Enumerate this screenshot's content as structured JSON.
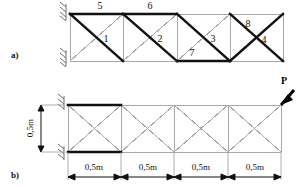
{
  "figure": {
    "panel_a": {
      "caption": "a)",
      "member_labels": [
        {
          "id": "m1",
          "text": "1",
          "x": 106,
          "y": 42
        },
        {
          "id": "m2",
          "text": "2",
          "x": 160,
          "y": 42
        },
        {
          "id": "m3",
          "text": "3",
          "x": 213,
          "y": 42
        },
        {
          "id": "m4",
          "text": "4",
          "x": 264,
          "y": 43
        },
        {
          "id": "m5",
          "text": "5",
          "x": 100,
          "y": 9
        },
        {
          "id": "m6",
          "text": "6",
          "x": 150,
          "y": 9
        },
        {
          "id": "m7",
          "text": "7",
          "x": 192,
          "y": 53
        },
        {
          "id": "m8",
          "text": "8",
          "x": 248,
          "y": 26
        }
      ]
    },
    "panel_b": {
      "caption": "b)",
      "load_label": "P",
      "height_dim": "0,5m",
      "span_dims": [
        "0,5m",
        "0,5m",
        "0,5m",
        "0,5m"
      ]
    }
  },
  "colors": {
    "bold_member": "#111111",
    "light_member": "#a8a8a8",
    "hatch": "#6e6e6e",
    "background": "#ffffff",
    "text": "#111111"
  }
}
